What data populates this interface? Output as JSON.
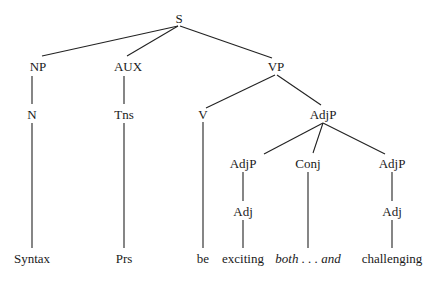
{
  "diagram": {
    "type": "syntax-tree",
    "line_color": "#222222",
    "text_color": "#1a1a1a",
    "nodes": [
      {
        "id": "S",
        "label": "S",
        "x": 179,
        "y": 18
      },
      {
        "id": "NP",
        "label": "NP",
        "x": 38,
        "y": 66
      },
      {
        "id": "AUX",
        "label": "AUX",
        "x": 128,
        "y": 66
      },
      {
        "id": "VP",
        "label": "VP",
        "x": 276,
        "y": 66
      },
      {
        "id": "N",
        "label": "N",
        "x": 32,
        "y": 114
      },
      {
        "id": "Tns",
        "label": "Tns",
        "x": 124,
        "y": 114
      },
      {
        "id": "V",
        "label": "V",
        "x": 203,
        "y": 114
      },
      {
        "id": "AdjP",
        "label": "AdjP",
        "x": 323,
        "y": 114
      },
      {
        "id": "AdjP_left",
        "label": "AdjP",
        "x": 243,
        "y": 163
      },
      {
        "id": "Conj",
        "label": "Conj",
        "x": 308,
        "y": 163
      },
      {
        "id": "AdjP_right",
        "label": "AdjP",
        "x": 392,
        "y": 163
      },
      {
        "id": "Adj_left",
        "label": "Adj",
        "x": 243,
        "y": 211
      },
      {
        "id": "Adj_right",
        "label": "Adj",
        "x": 392,
        "y": 211
      },
      {
        "id": "Syntax",
        "label": "Syntax",
        "x": 32,
        "y": 258
      },
      {
        "id": "Prs",
        "label": "Prs",
        "x": 124,
        "y": 258
      },
      {
        "id": "be",
        "label": "be",
        "x": 203,
        "y": 258
      },
      {
        "id": "exciting",
        "label": "exciting",
        "x": 243,
        "y": 258
      },
      {
        "id": "both_and",
        "label": "both . . . and",
        "x": 308,
        "y": 258,
        "italic": true
      },
      {
        "id": "challenging",
        "label": "challenging",
        "x": 392,
        "y": 258
      }
    ],
    "edges": [
      {
        "from": "S",
        "to": "NP",
        "x1": 178,
        "y1": 26,
        "x2": 42,
        "y2": 56
      },
      {
        "from": "S",
        "to": "AUX",
        "x1": 178,
        "y1": 26,
        "x2": 127,
        "y2": 56
      },
      {
        "from": "S",
        "to": "VP",
        "x1": 180,
        "y1": 26,
        "x2": 272,
        "y2": 58
      },
      {
        "from": "NP",
        "to": "N",
        "x1": 32,
        "y1": 76,
        "x2": 32,
        "y2": 104
      },
      {
        "from": "AUX",
        "to": "Tns",
        "x1": 124,
        "y1": 76,
        "x2": 124,
        "y2": 104
      },
      {
        "from": "VP",
        "to": "V",
        "x1": 275,
        "y1": 75,
        "x2": 206,
        "y2": 108
      },
      {
        "from": "VP",
        "to": "AdjP",
        "x1": 277,
        "y1": 75,
        "x2": 321,
        "y2": 105
      },
      {
        "from": "V",
        "to": "be",
        "x1": 203,
        "y1": 122,
        "x2": 203,
        "y2": 248
      },
      {
        "from": "AdjP",
        "to": "AdjP_left",
        "x1": 323,
        "y1": 123,
        "x2": 264,
        "y2": 154
      },
      {
        "from": "AdjP",
        "to": "Conj",
        "x1": 323,
        "y1": 123,
        "x2": 313,
        "y2": 153
      },
      {
        "from": "AdjP",
        "to": "AdjP_right",
        "x1": 323,
        "y1": 123,
        "x2": 385,
        "y2": 154
      },
      {
        "from": "N",
        "to": "Syntax",
        "x1": 32,
        "y1": 123,
        "x2": 32,
        "y2": 248
      },
      {
        "from": "Tns",
        "to": "Prs",
        "x1": 124,
        "y1": 123,
        "x2": 124,
        "y2": 248
      },
      {
        "from": "AdjP_left",
        "to": "Adj_left",
        "x1": 243,
        "y1": 172,
        "x2": 243,
        "y2": 201
      },
      {
        "from": "Conj",
        "to": "both_and",
        "x1": 308,
        "y1": 172,
        "x2": 308,
        "y2": 248
      },
      {
        "from": "AdjP_right",
        "to": "Adj_right",
        "x1": 392,
        "y1": 172,
        "x2": 392,
        "y2": 201
      },
      {
        "from": "Adj_left",
        "to": "exciting",
        "x1": 243,
        "y1": 220,
        "x2": 243,
        "y2": 248
      },
      {
        "from": "Adj_right",
        "to": "challenging",
        "x1": 392,
        "y1": 220,
        "x2": 392,
        "y2": 248
      }
    ]
  }
}
